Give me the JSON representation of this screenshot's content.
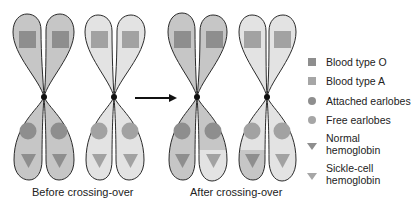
{
  "figure": {
    "captions": {
      "before": "Before crossing-over",
      "after": "After crossing-over"
    },
    "colors": {
      "dark_fill": "#c6c6c6",
      "light_fill": "#e3e3e3",
      "symbol_dark": "#8e8e8e",
      "symbol_light": "#a2a2a2",
      "outline": "#2a2a2a"
    },
    "arrow": {
      "from_x": 135,
      "to_x": 176,
      "y": 98,
      "label": ""
    }
  },
  "legend": {
    "items": [
      {
        "shape": "square",
        "label": "Blood type O",
        "color": "#8e8e8e"
      },
      {
        "shape": "square",
        "label": "Blood type A",
        "color": "#a6a6a6"
      },
      {
        "shape": "circle",
        "label": "Attached earlobes",
        "color": "#8e8e8e"
      },
      {
        "shape": "circle",
        "label": "Free earlobes",
        "color": "#a6a6a6"
      },
      {
        "shape": "triangle",
        "label_line1": "Normal",
        "label_line2": "hemoglobin",
        "color": "#8e8e8e"
      },
      {
        "shape": "triangle",
        "label_line1": "Sickle-cell",
        "label_line2": "hemoglobin",
        "color": "#a6a6a6"
      }
    ]
  }
}
